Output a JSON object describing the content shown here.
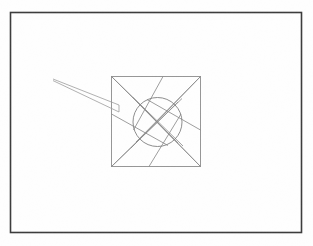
{
  "figure": {
    "caption": "",
    "background_color": "#fefefe",
    "image_size": {
      "width": 313,
      "height": 246
    }
  },
  "outer_frame": {
    "name": "outer-border-rectangle",
    "x": 10.5,
    "y": 12.5,
    "width": 291,
    "height": 220,
    "stroke_color": "#3a3a3a",
    "stroke_width": 1.6,
    "fill": "none"
  },
  "inner_square": {
    "name": "inner-square",
    "x": 111.5,
    "y": 76.5,
    "width": 89,
    "height": 90,
    "stroke_color": "#8a8a8a",
    "stroke_width": 0.9,
    "fill": "none"
  },
  "circle": {
    "name": "aperture-circle",
    "cx": 157.5,
    "cy": 122.0,
    "r": 24.5,
    "stroke_color": "#7e7e7e",
    "stroke_width": 0.9,
    "fill": "none"
  },
  "blades": {
    "stroke_color": "#8a8a8a",
    "stroke_width": 0.85,
    "description": "Four tangent blade lines forming the iris pinwheel, each running from a square corner past the circle tangentially.",
    "segments": [
      {
        "name": "blade-from-top-left",
        "x1": 111.5,
        "y1": 76.5,
        "x2": 183.0,
        "y2": 146.0
      },
      {
        "name": "blade-from-top-right",
        "x1": 200.5,
        "y1": 76.5,
        "x2": 131.0,
        "y2": 148.0
      },
      {
        "name": "blade-from-bottom-right",
        "x1": 200.5,
        "y1": 166.5,
        "x2": 132.5,
        "y2": 97.0
      },
      {
        "name": "blade-from-bottom-left",
        "x1": 111.5,
        "y1": 166.5,
        "x2": 182.0,
        "y2": 98.5
      },
      {
        "name": "blade-upper-chord",
        "x1": 111.5,
        "y1": 76.5,
        "x2": 178.0,
        "y2": 143.0
      },
      {
        "name": "blade-lower-chord",
        "x1": 200.5,
        "y1": 166.5,
        "x2": 137.0,
        "y2": 102.0
      },
      {
        "name": "blade-left-chord",
        "x1": 111.5,
        "y1": 166.5,
        "x2": 178.0,
        "y2": 102.0
      },
      {
        "name": "blade-right-chord",
        "x1": 200.5,
        "y1": 76.5,
        "x2": 136.0,
        "y2": 142.0
      },
      {
        "name": "blade-spur-top",
        "x1": 163.0,
        "y1": 76.5,
        "x2": 133.5,
        "y2": 130.0
      },
      {
        "name": "blade-spur-right",
        "x1": 200.5,
        "y1": 130.0,
        "x2": 147.0,
        "y2": 99.5
      },
      {
        "name": "blade-spur-bottom",
        "x1": 149.0,
        "y1": 166.5,
        "x2": 181.0,
        "y2": 114.0
      },
      {
        "name": "blade-spur-left",
        "x1": 111.5,
        "y1": 114.0,
        "x2": 168.0,
        "y2": 145.5
      }
    ]
  },
  "pointer_wedge": {
    "name": "pointer-wedge",
    "description": "Thin elongated double-line wedge entering the frame from the upper-left and terminating at the inner square's left edge.",
    "stroke_color": "#9a9a9a",
    "stroke_width": 0.8,
    "tip_x": 53.0,
    "tip_y": 79.0,
    "upper_end_x": 119.0,
    "upper_end_y": 105.0,
    "lower_end_x": 119.0,
    "lower_end_y": 112.0
  }
}
